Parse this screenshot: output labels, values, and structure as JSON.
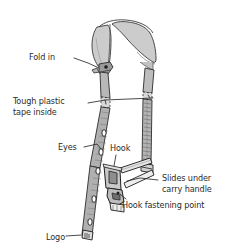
{
  "diagram": {
    "background_color": "#ffffff",
    "ink_color": "#2b2b2b",
    "fill_gray": "#cccccc",
    "fill_gray_dark": "#a8a8a8",
    "labels": [
      {
        "id": "fold-in",
        "text": "Fold in"
      },
      {
        "id": "tough-tape-1",
        "text": "Tough plastic"
      },
      {
        "id": "tough-tape-2",
        "text": "tape inside"
      },
      {
        "id": "eyes",
        "text": "Eyes"
      },
      {
        "id": "hook",
        "text": "Hook"
      },
      {
        "id": "slides-1",
        "text": "Slides under"
      },
      {
        "id": "slides-2",
        "text": "carry handle"
      },
      {
        "id": "hook-fasten",
        "text": "Hook fastening point"
      },
      {
        "id": "logo",
        "text": "Logo"
      }
    ]
  }
}
